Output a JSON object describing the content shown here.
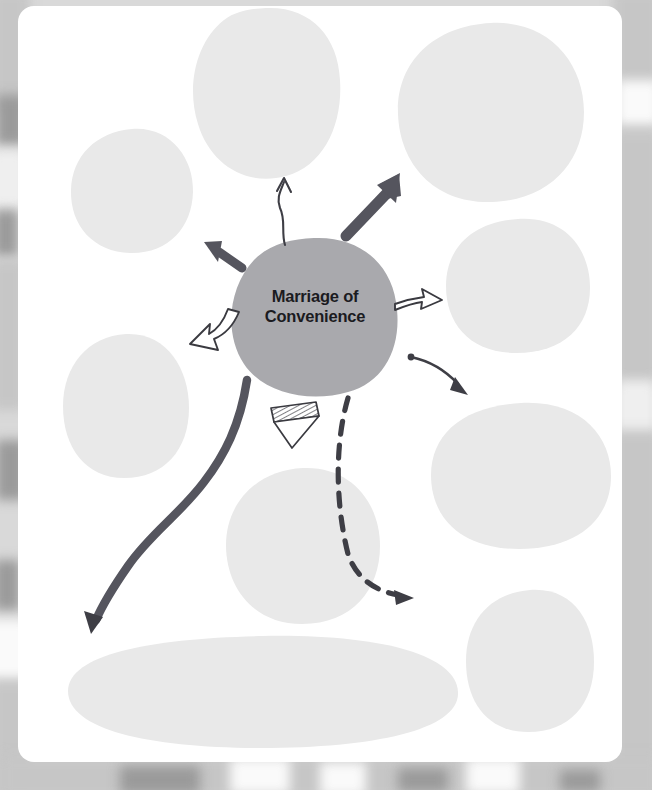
{
  "diagram": {
    "type": "concept-map",
    "title": "Marriage of Convenience",
    "background_color": "#d9d9d9",
    "card_color": "#ffffff",
    "center_node": {
      "label_line_1": "Marriage of",
      "label_line_2": "Convenience",
      "full_label": "Marriage of Convenience",
      "fill_color": "#a9a9ad",
      "text_color": "#1b1b1f",
      "shape": "hand-drawn-blob",
      "cx": 296,
      "cy": 310,
      "rx": 82,
      "ry": 78
    },
    "blob_fill_color": "#e9e9e9",
    "arrow_color": "#55555e",
    "outline_arrow_color": "#3a3a40",
    "blobs": [
      {
        "id": "blob-top-center",
        "label": "",
        "cx": 248,
        "cy": 86,
        "rx": 72,
        "ry": 84,
        "rotate": -4
      },
      {
        "id": "blob-top-right",
        "label": "",
        "cx": 473,
        "cy": 106,
        "rx": 93,
        "ry": 88,
        "rotate": 3
      },
      {
        "id": "blob-left-upper",
        "label": "",
        "cx": 114,
        "cy": 185,
        "rx": 61,
        "ry": 62,
        "rotate": -2
      },
      {
        "id": "blob-right-upper",
        "label": "",
        "cx": 500,
        "cy": 280,
        "rx": 72,
        "ry": 67,
        "rotate": 5
      },
      {
        "id": "blob-left-lower",
        "label": "",
        "cx": 108,
        "cy": 400,
        "rx": 63,
        "ry": 72,
        "rotate": 4
      },
      {
        "id": "blob-right-mid",
        "label": "",
        "cx": 503,
        "cy": 470,
        "rx": 90,
        "ry": 73,
        "rotate": -3
      },
      {
        "id": "blob-bottom-center",
        "label": "",
        "cx": 285,
        "cy": 540,
        "rx": 77,
        "ry": 78,
        "rotate": 2
      },
      {
        "id": "blob-right-lower",
        "label": "",
        "cx": 512,
        "cy": 655,
        "rx": 64,
        "ry": 71,
        "rotate": -6
      },
      {
        "id": "blob-bottom-wide",
        "label": "",
        "cx": 245,
        "cy": 686,
        "rx": 195,
        "ry": 56,
        "rotate": -1
      }
    ],
    "arrows": [
      {
        "id": "arrow-thin-up",
        "style": "thin-handdrawn",
        "from": "center",
        "to": "blob-top-center",
        "direction": "up"
      },
      {
        "id": "arrow-thick-upright",
        "style": "thick-solid",
        "from": "center",
        "to": "blob-top-right",
        "direction": "up-right"
      },
      {
        "id": "arrow-thick-upleft",
        "style": "thick-solid",
        "from": "center",
        "to": "blob-left-upper",
        "direction": "up-left"
      },
      {
        "id": "arrow-hollow-right",
        "style": "hollow-outline",
        "from": "center",
        "to": "blob-right-upper",
        "direction": "right"
      },
      {
        "id": "arrow-hollow-left",
        "style": "hollow-outline-curved",
        "from": "center",
        "to": "blob-left-lower",
        "direction": "left-down"
      },
      {
        "id": "arrow-hatched-down",
        "style": "hatched-triangle",
        "from": "center",
        "to": "blob-bottom-center",
        "direction": "down"
      },
      {
        "id": "arrow-dot-curve",
        "style": "dot-start-curve",
        "from": "center",
        "to": "blob-right-mid",
        "direction": "right-down"
      },
      {
        "id": "arrow-dashed-curve",
        "style": "dashed-curve",
        "from": "center",
        "to": "blob-right-lower",
        "direction": "down-right"
      },
      {
        "id": "arrow-tapered-scurve",
        "style": "tapered-s-curve",
        "from": "center",
        "to": "blob-bottom-wide",
        "direction": "down-left"
      }
    ]
  }
}
